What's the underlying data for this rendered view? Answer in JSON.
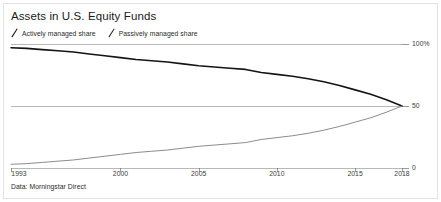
{
  "card": {
    "title": "Assets in U.S. Equity Funds",
    "source": "Data: Morningstar Direct"
  },
  "legend": {
    "items": [
      {
        "label": "Actively managed share",
        "marker": "slash-icon",
        "color": "#141414"
      },
      {
        "label": "Passively managed share",
        "marker": "slash-icon",
        "color": "#8c8c8c"
      }
    ]
  },
  "chart_data": {
    "type": "line",
    "title": "Assets in U.S. Equity Funds",
    "subtitle": "",
    "xlabel": "",
    "ylabel": "",
    "xlim": [
      1993,
      2018
    ],
    "ylim": [
      0,
      100
    ],
    "grid": true,
    "legend_position": "top-left",
    "y_ticks": [
      0,
      50,
      100
    ],
    "y_tick_labels": [
      "0",
      "50",
      "100%"
    ],
    "y_axis_side": "right",
    "x_ticks": [
      1993,
      2000,
      2005,
      2010,
      2015,
      2018
    ],
    "x_tick_labels": [
      "1993",
      "2000",
      "2005",
      "2010",
      "2015",
      "2018"
    ],
    "x": [
      1993,
      1994,
      1995,
      1996,
      1997,
      1998,
      1999,
      2000,
      2001,
      2002,
      2003,
      2004,
      2005,
      2006,
      2007,
      2008,
      2009,
      2010,
      2011,
      2012,
      2013,
      2014,
      2015,
      2016,
      2017,
      2018
    ],
    "series": [
      {
        "name": "Actively managed share",
        "color": "#141414",
        "values": [
          97,
          96.5,
          95.5,
          94.5,
          93.5,
          92,
          90.5,
          89,
          87.5,
          86.5,
          85.5,
          84,
          82.5,
          81.5,
          80.5,
          79.5,
          77,
          75.5,
          74,
          72,
          69.5,
          66.5,
          63,
          59.5,
          55,
          50
        ]
      },
      {
        "name": "Passively managed share",
        "color": "#8c8c8c",
        "values": [
          3,
          3.5,
          4.5,
          5.5,
          6.5,
          8,
          9.5,
          11,
          12.5,
          13.5,
          14.5,
          16,
          17.5,
          18.5,
          19.5,
          20.5,
          23,
          24.5,
          26,
          28,
          30.5,
          33.5,
          37,
          40.5,
          45,
          50
        ]
      }
    ]
  }
}
